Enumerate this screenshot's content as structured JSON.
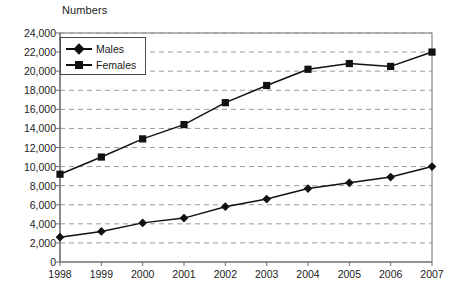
{
  "chart_data": {
    "type": "line",
    "title": "",
    "ylabel": "Numbers",
    "xlabel": "",
    "categories": [
      "1998",
      "1999",
      "2000",
      "2001",
      "2002",
      "2003",
      "2004",
      "2005",
      "2006",
      "2007"
    ],
    "ylim": [
      0,
      24000
    ],
    "ytick_values": [
      0,
      2000,
      4000,
      6000,
      8000,
      10000,
      12000,
      14000,
      16000,
      18000,
      20000,
      22000,
      24000
    ],
    "ytick_labels": [
      "0",
      "2,000",
      "4,000",
      "6,000",
      "8,000",
      "10,000",
      "12,000",
      "14,000",
      "16,000",
      "18,000",
      "20,000",
      "22,000",
      "24,000"
    ],
    "grid": true,
    "grid_style": "dashed-horizontal",
    "legend_position": "top-left-inside",
    "series": [
      {
        "name": "Males",
        "marker": "diamond",
        "color": "#111111",
        "values": [
          2600,
          3200,
          4100,
          4600,
          5800,
          6600,
          7700,
          8300,
          8900,
          10000
        ]
      },
      {
        "name": "Females",
        "marker": "square",
        "color": "#111111",
        "values": [
          9200,
          11000,
          12900,
          14400,
          16700,
          18500,
          20200,
          20800,
          20500,
          22000
        ]
      }
    ]
  },
  "colors": {
    "line": "#111111",
    "grid": "#9a9a9a",
    "axis": "#6f6f6f",
    "text": "#1a1a1a",
    "background": "#ffffff"
  },
  "legend": {
    "items": [
      {
        "label": "Males"
      },
      {
        "label": "Females"
      }
    ]
  }
}
